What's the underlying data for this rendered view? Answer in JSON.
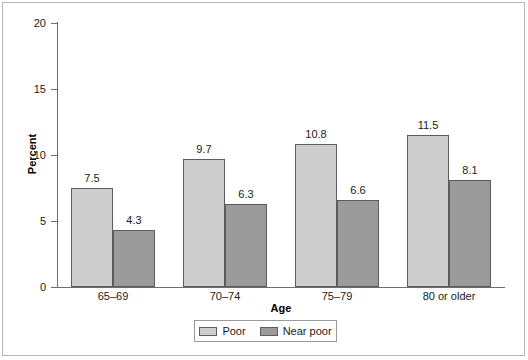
{
  "chart_data": {
    "type": "bar",
    "title": "",
    "xlabel": "Age",
    "ylabel": "Percent",
    "categories": [
      "65–69",
      "70–74",
      "75–79",
      "80 or older"
    ],
    "series": [
      {
        "name": "Poor",
        "values": [
          7.5,
          9.7,
          10.8,
          11.5
        ],
        "color": "#cdcdcd"
      },
      {
        "name": "Near poor",
        "values": [
          4.3,
          6.3,
          6.6,
          8.1
        ],
        "color": "#9b9b9b"
      }
    ],
    "ylim": [
      0,
      20
    ],
    "yticks": [
      0,
      5,
      10,
      15,
      20
    ],
    "ytick_labels": [
      "0",
      "5",
      "10",
      "15",
      "20"
    ],
    "grid": false,
    "legend_position": "bottom-center",
    "data_labels": [
      "7.5",
      "4.3",
      "9.7",
      "6.3",
      "10.8",
      "6.6",
      "11.5",
      "8.1"
    ]
  },
  "legend": {
    "entries": [
      {
        "label": "Poor"
      },
      {
        "label": "Near poor"
      }
    ]
  }
}
